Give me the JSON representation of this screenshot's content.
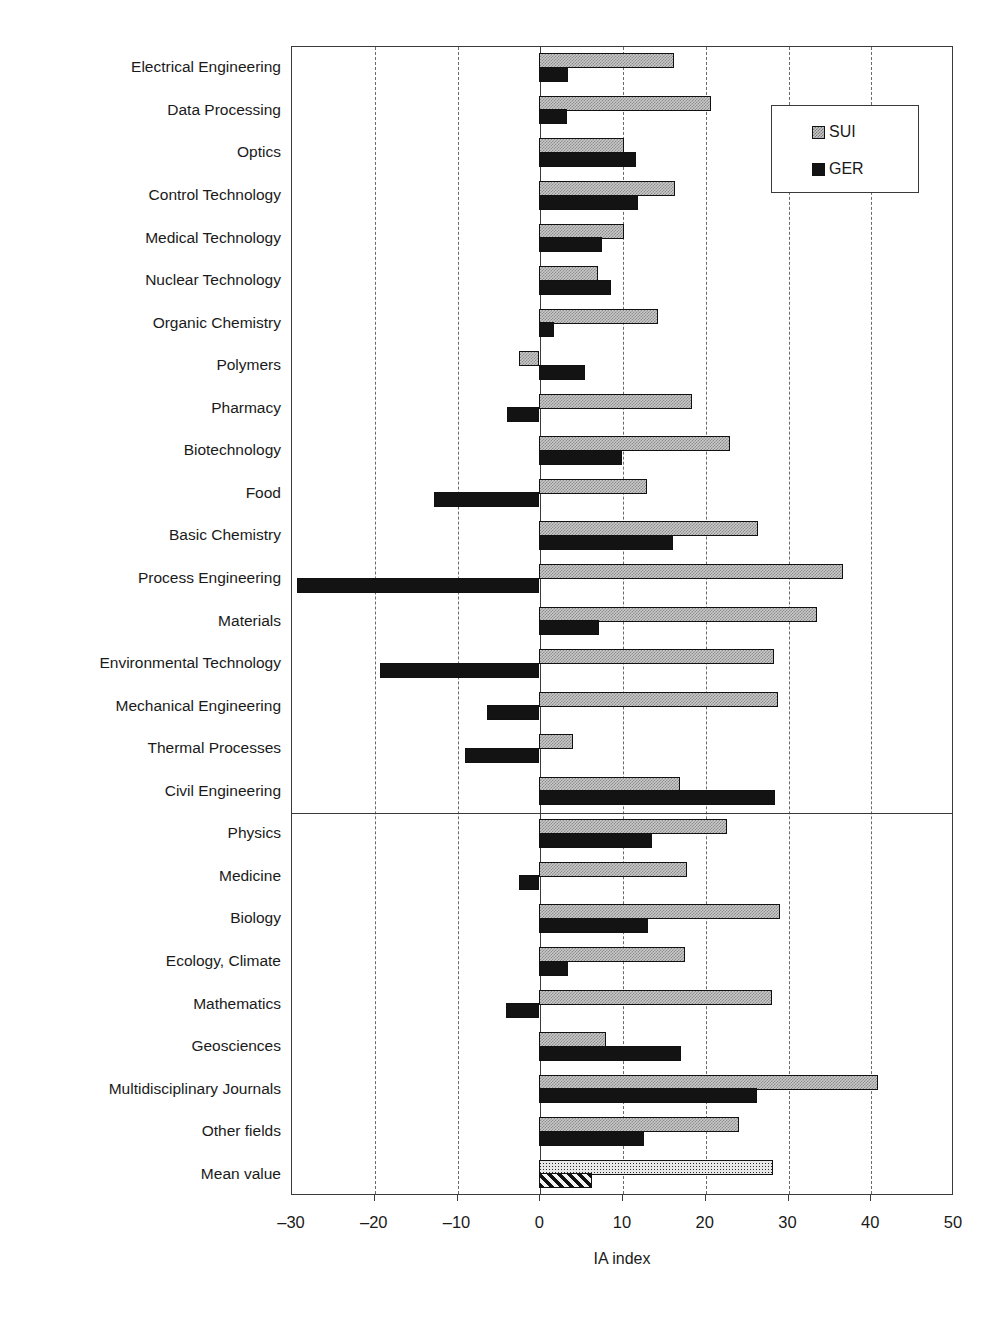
{
  "chart_data": {
    "type": "bar",
    "orientation": "horizontal",
    "title": "",
    "xlabel": "IA index",
    "ylabel": "",
    "xlim": [
      -30,
      50
    ],
    "xticks": [
      -30,
      -20,
      -10,
      0,
      10,
      20,
      30,
      40,
      50
    ],
    "xticklabels": [
      "–30",
      "–20",
      "–10",
      "0",
      "10",
      "20",
      "30",
      "40",
      "50"
    ],
    "grid": "vertical dashed at every 10 units",
    "legend": {
      "position": "upper right",
      "entries": [
        "SUI",
        "GER"
      ]
    },
    "group_separator_after": "Civil Engineering",
    "categories": [
      "Electrical Engineering",
      "Data Processing",
      "Optics",
      "Control Technology",
      "Medical Technology",
      "Nuclear Technology",
      "Organic Chemistry",
      "Polymers",
      "Pharmacy",
      "Biotechnology",
      "Food",
      "Basic Chemistry",
      "Process Engineering",
      "Materials",
      "Environmental Technology",
      "Mechanical Engineering",
      "Thermal Processes",
      "Civil Engineering",
      "Physics",
      "Medicine",
      "Biology",
      "Ecology, Climate",
      "Mathematics",
      "Geosciences",
      "Multidisciplinary Journals",
      "Other fields",
      "Mean value"
    ],
    "series": [
      {
        "name": "SUI",
        "values": [
          16.3,
          20.7,
          10.3,
          16.4,
          10.3,
          7.1,
          14.3,
          -2.4,
          18.5,
          23.0,
          13.0,
          26.4,
          36.7,
          33.6,
          28.4,
          28.8,
          4.1,
          17.0,
          22.7,
          17.9,
          29.1,
          17.6,
          28.1,
          8.1,
          40.9,
          24.1,
          28.3
        ]
      },
      {
        "name": "GER",
        "values": [
          3.5,
          3.4,
          11.7,
          11.9,
          7.6,
          8.7,
          1.8,
          5.5,
          -3.9,
          10.0,
          -12.7,
          16.2,
          -29.3,
          7.2,
          -19.3,
          -6.3,
          -9.0,
          28.5,
          13.6,
          -2.5,
          13.1,
          3.5,
          -4.0,
          17.1,
          26.3,
          12.6,
          6.4
        ]
      }
    ]
  },
  "legend": {
    "sui_label": "SUI",
    "ger_label": "GER"
  },
  "axis": {
    "xlabel": "IA index"
  }
}
